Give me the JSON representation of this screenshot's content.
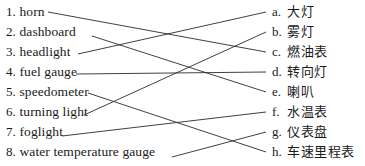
{
  "exercise": {
    "type": "matching-exercise",
    "left_column": {
      "items": [
        {
          "marker": "1.",
          "label": "horn",
          "y": 12
        },
        {
          "marker": "2.",
          "label": "dashboard",
          "y": 32
        },
        {
          "marker": "3.",
          "label": "headlight",
          "y": 52
        },
        {
          "marker": "4.",
          "label": "fuel gauge",
          "y": 72
        },
        {
          "marker": "5.",
          "label": "speedometer",
          "y": 92
        },
        {
          "marker": "6.",
          "label": "turning light",
          "y": 112
        },
        {
          "marker": "7.",
          "label": "foglight",
          "y": 132
        },
        {
          "marker": "8.",
          "label": "water temperature gauge",
          "y": 152
        }
      ]
    },
    "right_column": {
      "items": [
        {
          "marker": "a.",
          "label": "大灯",
          "y": 12
        },
        {
          "marker": "b.",
          "label": "雾灯",
          "y": 32
        },
        {
          "marker": "c.",
          "label": "燃油表",
          "y": 52
        },
        {
          "marker": "d.",
          "label": "转向灯",
          "y": 72
        },
        {
          "marker": "e.",
          "label": "喇叭",
          "y": 92
        },
        {
          "marker": "f.",
          "label": "水温表",
          "y": 112
        },
        {
          "marker": "g.",
          "label": "仪表盘",
          "y": 132
        },
        {
          "marker": "h.",
          "label": "车速里程表",
          "y": 152
        }
      ]
    },
    "connections": [
      {
        "from": "1",
        "to": "c",
        "x1": 48,
        "y1": 12,
        "x2": 266,
        "y2": 52
      },
      {
        "from": "2",
        "to": "e",
        "x1": 92,
        "y1": 36,
        "x2": 266,
        "y2": 92
      },
      {
        "from": "3",
        "to": "a",
        "x1": 78,
        "y1": 54,
        "x2": 266,
        "y2": 12
      },
      {
        "from": "4",
        "to": "d",
        "x1": 76,
        "y1": 74,
        "x2": 266,
        "y2": 72
      },
      {
        "from": "5",
        "to": "h",
        "x1": 88,
        "y1": 93,
        "x2": 266,
        "y2": 152
      },
      {
        "from": "6",
        "to": "b",
        "x1": 84,
        "y1": 115,
        "x2": 266,
        "y2": 32
      },
      {
        "from": "7",
        "to": "f",
        "x1": 62,
        "y1": 136,
        "x2": 266,
        "y2": 112
      },
      {
        "from": "8",
        "to": "g",
        "x1": 172,
        "y1": 157,
        "x2": 266,
        "y2": 132
      }
    ],
    "line_color": "#2a2a2a"
  }
}
